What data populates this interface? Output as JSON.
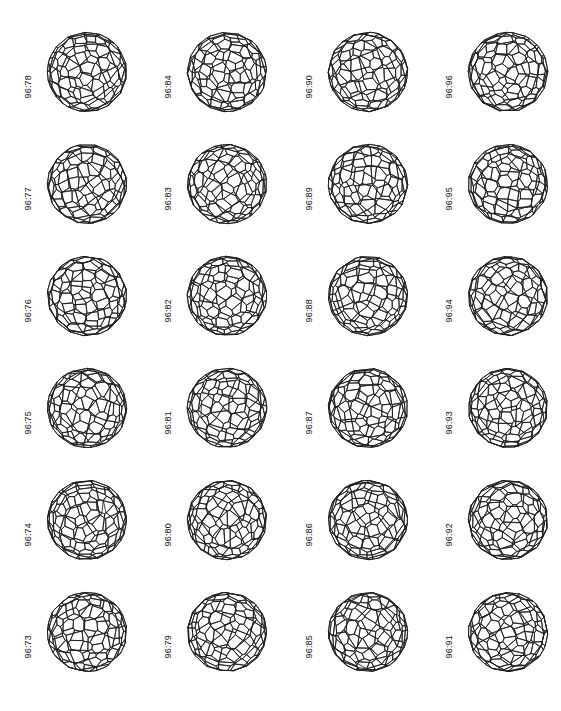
{
  "figure": {
    "kind": "fullerene-isomer-plate",
    "background_color": "#ffffff",
    "line_color": "#1c1c1c",
    "columns": 4,
    "rows": 6,
    "cage_count": 24
  },
  "chart_data": {
    "type": "table",
    "title": "",
    "xlabel": "",
    "ylabel": "",
    "grid": false,
    "layout": "4 columns x 6 rows, column-major numbering increasing upward",
    "categories": [
      "96:78",
      "96:84",
      "96:90",
      "96:96",
      "96:77",
      "96:83",
      "96:89",
      "96:95",
      "96:76",
      "96:82",
      "96:88",
      "96:94",
      "96:75",
      "96:81",
      "96:87",
      "96:93",
      "96:74",
      "96:80",
      "96:86",
      "96:92",
      "96:73",
      "96:79",
      "96:85",
      "96:91"
    ],
    "values": [
      78,
      84,
      90,
      96,
      77,
      83,
      89,
      95,
      76,
      82,
      88,
      94,
      75,
      81,
      87,
      93,
      74,
      80,
      86,
      92,
      73,
      79,
      85,
      91
    ]
  },
  "cells": [
    {
      "label": "96:78",
      "row": 1,
      "col": 1,
      "seed": 78
    },
    {
      "label": "96:84",
      "row": 1,
      "col": 2,
      "seed": 84
    },
    {
      "label": "96:90",
      "row": 1,
      "col": 3,
      "seed": 90
    },
    {
      "label": "96:96",
      "row": 1,
      "col": 4,
      "seed": 96
    },
    {
      "label": "96:77",
      "row": 2,
      "col": 1,
      "seed": 77
    },
    {
      "label": "96:83",
      "row": 2,
      "col": 2,
      "seed": 83
    },
    {
      "label": "96:89",
      "row": 2,
      "col": 3,
      "seed": 89
    },
    {
      "label": "96:95",
      "row": 2,
      "col": 4,
      "seed": 95
    },
    {
      "label": "96:76",
      "row": 3,
      "col": 1,
      "seed": 76
    },
    {
      "label": "96:82",
      "row": 3,
      "col": 2,
      "seed": 82
    },
    {
      "label": "96:88",
      "row": 3,
      "col": 3,
      "seed": 88
    },
    {
      "label": "96:94",
      "row": 3,
      "col": 4,
      "seed": 94
    },
    {
      "label": "96:75",
      "row": 4,
      "col": 1,
      "seed": 75
    },
    {
      "label": "96:81",
      "row": 4,
      "col": 2,
      "seed": 81
    },
    {
      "label": "96:87",
      "row": 4,
      "col": 3,
      "seed": 87
    },
    {
      "label": "96:93",
      "row": 4,
      "col": 4,
      "seed": 93
    },
    {
      "label": "96:74",
      "row": 5,
      "col": 1,
      "seed": 74
    },
    {
      "label": "96:80",
      "row": 5,
      "col": 2,
      "seed": 80
    },
    {
      "label": "96:86",
      "row": 5,
      "col": 3,
      "seed": 86
    },
    {
      "label": "96:92",
      "row": 5,
      "col": 4,
      "seed": 92
    },
    {
      "label": "96:73",
      "row": 6,
      "col": 1,
      "seed": 73
    },
    {
      "label": "96:79",
      "row": 6,
      "col": 2,
      "seed": 79
    },
    {
      "label": "96:85",
      "row": 6,
      "col": 3,
      "seed": 85
    },
    {
      "label": "96:91",
      "row": 6,
      "col": 4,
      "seed": 91
    }
  ]
}
